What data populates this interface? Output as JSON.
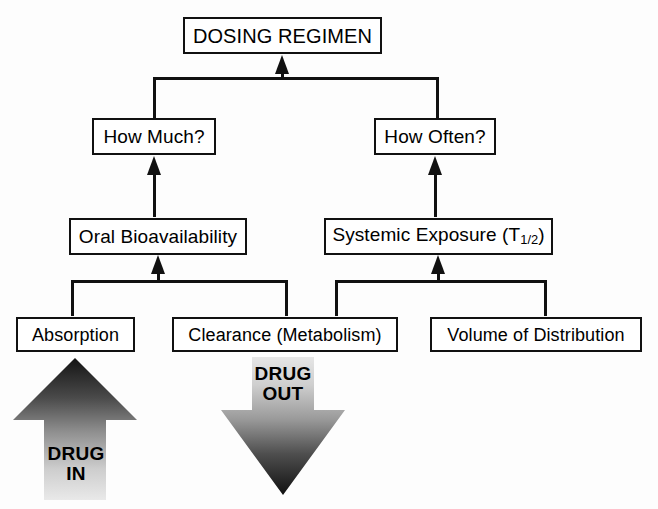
{
  "diagram": {
    "type": "flowchart",
    "line_color": "#111111",
    "background": "#ffffff",
    "nodes": {
      "dosing_regimen": "DOSING REGIMEN",
      "how_much": "How Much?",
      "how_often": "How Often?",
      "oral_bioavailability": "Oral Bioavailability",
      "systemic_exposure_prefix": "Systemic Exposure (T",
      "systemic_exposure_sub": "1/2",
      "systemic_exposure_suffix": ")",
      "absorption": "Absorption",
      "clearance": "Clearance (Metabolism)",
      "volume_of_distribution": "Volume of Distribution"
    },
    "arrows": {
      "drug_in": "DRUG\nIN",
      "drug_out": "DRUG\nOUT"
    },
    "edges": [
      {
        "from": "how_much",
        "to": "dosing_regimen",
        "style": "bracket-merge"
      },
      {
        "from": "how_often",
        "to": "dosing_regimen",
        "style": "bracket-merge"
      },
      {
        "from": "oral_bioavailability",
        "to": "how_much",
        "style": "arrow-up"
      },
      {
        "from": "systemic_exposure",
        "to": "how_often",
        "style": "arrow-up"
      },
      {
        "from": "absorption",
        "to": "oral_bioavailability",
        "style": "bracket-merge"
      },
      {
        "from": "clearance",
        "to": "oral_bioavailability",
        "style": "bracket-merge"
      },
      {
        "from": "clearance",
        "to": "systemic_exposure",
        "style": "bracket-merge"
      },
      {
        "from": "volume_of_distribution",
        "to": "systemic_exposure",
        "style": "bracket-merge"
      }
    ]
  }
}
